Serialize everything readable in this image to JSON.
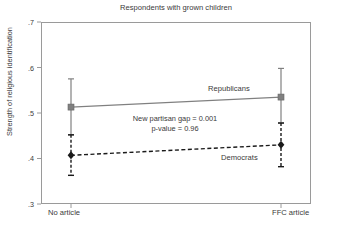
{
  "chart_data": {
    "type": "line",
    "title": "Respondents with grown children",
    "xlabel": "",
    "ylabel": "Strength of religious identification",
    "categories": [
      "No article",
      "FFC article"
    ],
    "ylim": [
      0.3,
      0.7
    ],
    "yticks": [
      0.3,
      0.4,
      0.5,
      0.6,
      0.7
    ],
    "ytick_labels": [
      ".3",
      ".4",
      ".5",
      ".6",
      ".7"
    ],
    "grid": false,
    "legend_position": "inline-annotations",
    "series": [
      {
        "name": "Republicans",
        "values": [
          0.513,
          0.535
        ],
        "errors_low": [
          0.452,
          0.478
        ],
        "errors_high": [
          0.575,
          0.598
        ],
        "line_style": "solid",
        "color": "#808080",
        "marker": "square"
      },
      {
        "name": "Democrats",
        "values": [
          0.407,
          0.43
        ],
        "errors_low": [
          0.363,
          0.382
        ],
        "errors_high": [
          0.452,
          0.478
        ],
        "line_style": "dashed",
        "color": "#1a1a1a",
        "marker": "diamond"
      }
    ],
    "annotations": [
      "New partisan gap = 0.001",
      "p-value = 0.96"
    ]
  },
  "labels": {
    "title": "Respondents with grown children",
    "y_axis_title": "Strength of religious identification",
    "ytick_0": ".3",
    "ytick_1": ".4",
    "ytick_2": ".5",
    "ytick_3": ".6",
    "ytick_4": ".7",
    "xtick_0": "No article",
    "xtick_1": "FFC article",
    "series_republicans": "Republicans",
    "series_democrats": "Democrats",
    "annotation_line1": "New partisan gap = 0.001",
    "annotation_line2": "p-value = 0.96"
  },
  "colors": {
    "republican_line": "#808080",
    "democrat_line": "#1a1a1a",
    "axis": "#9a9a9a",
    "text": "#3a3a3a",
    "background": "#ffffff"
  }
}
